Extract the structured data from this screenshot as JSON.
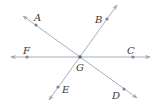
{
  "diagram": {
    "type": "intersecting-lines",
    "colors": {
      "line": "#9aa6b2",
      "point": "#7a8794",
      "label": "#3a3a3a"
    },
    "intersection": {
      "name": "G",
      "x": 80,
      "y": 57,
      "label_x": 76,
      "label_y": 71
    },
    "lines": [
      {
        "name": "line-AD",
        "from": {
          "x": 23,
          "y": 16
        },
        "to": {
          "x": 137,
          "y": 98
        },
        "points": [
          {
            "name": "A",
            "x": 36,
            "y": 25,
            "label_x": 34,
            "label_y": 21
          },
          {
            "name": "D",
            "x": 124,
            "y": 89,
            "label_x": 112,
            "label_y": 99
          }
        ]
      },
      {
        "name": "line-BE",
        "from": {
          "x": 117,
          "y": 5
        },
        "to": {
          "x": 49,
          "y": 100
        },
        "points": [
          {
            "name": "B",
            "x": 107,
            "y": 19,
            "label_x": 95,
            "label_y": 23
          },
          {
            "name": "E",
            "x": 58,
            "y": 87,
            "label_x": 62,
            "label_y": 93
          }
        ]
      },
      {
        "name": "line-FC",
        "from": {
          "x": 11,
          "y": 57
        },
        "to": {
          "x": 150,
          "y": 57
        },
        "points": [
          {
            "name": "F",
            "x": 27,
            "y": 57,
            "label_x": 23,
            "label_y": 54
          },
          {
            "name": "C",
            "x": 133,
            "y": 57,
            "label_x": 127,
            "label_y": 54
          }
        ]
      }
    ],
    "labels": {
      "A": "A",
      "B": "B",
      "C": "C",
      "D": "D",
      "E": "E",
      "F": "F",
      "G": "G"
    }
  }
}
